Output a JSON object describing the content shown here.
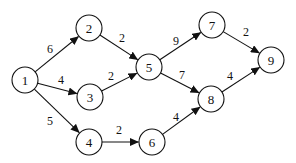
{
  "diagram": {
    "type": "directed-weighted-graph",
    "node_radius": 13,
    "nodes": [
      {
        "id": "1",
        "label": "1",
        "x": 25,
        "y": 80
      },
      {
        "id": "2",
        "label": "2",
        "x": 89,
        "y": 28
      },
      {
        "id": "3",
        "label": "3",
        "x": 90,
        "y": 97
      },
      {
        "id": "4",
        "label": "4",
        "x": 89,
        "y": 142
      },
      {
        "id": "5",
        "label": "5",
        "x": 149,
        "y": 67
      },
      {
        "id": "6",
        "label": "6",
        "x": 152,
        "y": 142
      },
      {
        "id": "7",
        "label": "7",
        "x": 212,
        "y": 25
      },
      {
        "id": "8",
        "label": "8",
        "x": 211,
        "y": 99
      },
      {
        "id": "9",
        "label": "9",
        "x": 271,
        "y": 60
      }
    ],
    "edges": [
      {
        "from": "1",
        "to": "2",
        "weight": "6",
        "lx": 50,
        "ly": 49
      },
      {
        "from": "1",
        "to": "3",
        "weight": "4",
        "lx": 61,
        "ly": 80
      },
      {
        "from": "1",
        "to": "4",
        "weight": "5",
        "lx": 50,
        "ly": 121
      },
      {
        "from": "2",
        "to": "5",
        "weight": "2",
        "lx": 122,
        "ly": 38
      },
      {
        "from": "3",
        "to": "5",
        "weight": "2",
        "lx": 111,
        "ly": 76
      },
      {
        "from": "4",
        "to": "6",
        "weight": "2",
        "lx": 119,
        "ly": 130
      },
      {
        "from": "5",
        "to": "7",
        "weight": "9",
        "lx": 176,
        "ly": 41
      },
      {
        "from": "5",
        "to": "8",
        "weight": "7",
        "lx": 182,
        "ly": 75
      },
      {
        "from": "6",
        "to": "8",
        "weight": "4",
        "lx": 176,
        "ly": 117
      },
      {
        "from": "7",
        "to": "9",
        "weight": "2",
        "lx": 246,
        "ly": 32
      },
      {
        "from": "8",
        "to": "9",
        "weight": "4",
        "lx": 230,
        "ly": 76
      }
    ]
  }
}
